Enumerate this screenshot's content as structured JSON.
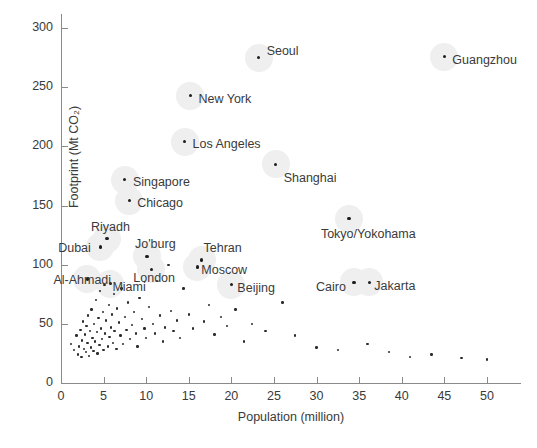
{
  "chart_data": {
    "type": "scatter",
    "title": "",
    "xlabel": "Population (million)",
    "ylabel": "Footprint (Mt CO₂)",
    "xlim": [
      0,
      54
    ],
    "ylim": [
      0,
      312
    ],
    "xticks": [
      0,
      5,
      10,
      15,
      20,
      25,
      30,
      35,
      40,
      45,
      50
    ],
    "yticks": [
      0,
      50,
      100,
      150,
      200,
      250,
      300
    ],
    "grid": false,
    "legend": null,
    "labeled_points": [
      {
        "label": "Seoul",
        "x": 23.2,
        "y": 275,
        "label_dx": 8,
        "label_dy": -6
      },
      {
        "label": "Guangzhou",
        "x": 45.0,
        "y": 276,
        "label_dx": 8,
        "label_dy": 4
      },
      {
        "label": "New York",
        "x": 15.2,
        "y": 243,
        "label_dx": 8,
        "label_dy": 4
      },
      {
        "label": "Los Angeles",
        "x": 14.5,
        "y": 204,
        "label_dx": 8,
        "label_dy": 3
      },
      {
        "label": "Shanghai",
        "x": 25.2,
        "y": 185,
        "label_dx": 8,
        "label_dy": 15
      },
      {
        "label": "Singapore",
        "x": 7.5,
        "y": 172,
        "label_dx": 8,
        "label_dy": 3
      },
      {
        "label": "Chicago",
        "x": 8.0,
        "y": 154,
        "label_dx": 8,
        "label_dy": 3
      },
      {
        "label": "Tokyo/Yokohama",
        "x": 33.8,
        "y": 139,
        "label_dx": -28,
        "label_dy": 16
      },
      {
        "label": "Riyadh",
        "x": 5.4,
        "y": 122,
        "label_dx": -16,
        "label_dy": -11
      },
      {
        "label": "Dubai",
        "x": 4.6,
        "y": 115,
        "label_dx": -42,
        "label_dy": 2
      },
      {
        "label": "Jo'burg",
        "x": 10.1,
        "y": 107,
        "label_dx": -12,
        "label_dy": -11
      },
      {
        "label": "Tehran",
        "x": 16.5,
        "y": 104,
        "label_dx": 2,
        "label_dy": -11
      },
      {
        "label": "Moscow",
        "x": 16.0,
        "y": 98,
        "label_dx": 4,
        "label_dy": 4
      },
      {
        "label": "London",
        "x": 10.6,
        "y": 96,
        "label_dx": -18,
        "label_dy": 10
      },
      {
        "label": "Al-Ahmadi",
        "x": 3.1,
        "y": 88,
        "label_dx": -34,
        "label_dy": 2
      },
      {
        "label": "Miami",
        "x": 5.8,
        "y": 84,
        "label_dx": 2,
        "label_dy": 4
      },
      {
        "label": "Beijing",
        "x": 20.0,
        "y": 83,
        "label_dx": 6,
        "label_dy": 4
      },
      {
        "label": "Cairo",
        "x": 34.4,
        "y": 85,
        "label_dx": -38,
        "label_dy": 6
      },
      {
        "label": "Jakarta",
        "x": 36.2,
        "y": 85,
        "label_dx": 5,
        "label_dy": 5
      }
    ],
    "unlabeled_points": [
      {
        "x": 1.2,
        "y": 33
      },
      {
        "x": 1.5,
        "y": 28
      },
      {
        "x": 1.8,
        "y": 40
      },
      {
        "x": 2.0,
        "y": 24
      },
      {
        "x": 2.1,
        "y": 31
      },
      {
        "x": 2.3,
        "y": 45
      },
      {
        "x": 2.4,
        "y": 22
      },
      {
        "x": 2.5,
        "y": 36
      },
      {
        "x": 2.6,
        "y": 52
      },
      {
        "x": 2.7,
        "y": 29
      },
      {
        "x": 2.8,
        "y": 41
      },
      {
        "x": 2.9,
        "y": 26
      },
      {
        "x": 3.0,
        "y": 48
      },
      {
        "x": 3.1,
        "y": 34
      },
      {
        "x": 3.2,
        "y": 57
      },
      {
        "x": 3.3,
        "y": 23
      },
      {
        "x": 3.4,
        "y": 44
      },
      {
        "x": 3.5,
        "y": 30
      },
      {
        "x": 3.6,
        "y": 62
      },
      {
        "x": 3.7,
        "y": 38
      },
      {
        "x": 3.8,
        "y": 27
      },
      {
        "x": 3.9,
        "y": 50
      },
      {
        "x": 4.0,
        "y": 35
      },
      {
        "x": 4.1,
        "y": 70
      },
      {
        "x": 4.2,
        "y": 43
      },
      {
        "x": 4.3,
        "y": 25
      },
      {
        "x": 4.4,
        "y": 55
      },
      {
        "x": 4.5,
        "y": 32
      },
      {
        "x": 4.6,
        "y": 78
      },
      {
        "x": 4.7,
        "y": 46
      },
      {
        "x": 4.8,
        "y": 37
      },
      {
        "x": 4.9,
        "y": 60
      },
      {
        "x": 5.0,
        "y": 28
      },
      {
        "x": 5.1,
        "y": 83
      },
      {
        "x": 5.2,
        "y": 42
      },
      {
        "x": 5.3,
        "y": 53
      },
      {
        "x": 5.5,
        "y": 31
      },
      {
        "x": 5.6,
        "y": 66
      },
      {
        "x": 5.7,
        "y": 39
      },
      {
        "x": 5.9,
        "y": 47
      },
      {
        "x": 6.0,
        "y": 58
      },
      {
        "x": 6.1,
        "y": 34
      },
      {
        "x": 6.2,
        "y": 75
      },
      {
        "x": 6.3,
        "y": 44
      },
      {
        "x": 6.5,
        "y": 29
      },
      {
        "x": 6.6,
        "y": 63
      },
      {
        "x": 6.8,
        "y": 51
      },
      {
        "x": 7.0,
        "y": 40
      },
      {
        "x": 7.1,
        "y": 80
      },
      {
        "x": 7.3,
        "y": 33
      },
      {
        "x": 7.5,
        "y": 56
      },
      {
        "x": 7.7,
        "y": 45
      },
      {
        "x": 7.9,
        "y": 68
      },
      {
        "x": 8.1,
        "y": 37
      },
      {
        "x": 8.3,
        "y": 49
      },
      {
        "x": 8.6,
        "y": 60
      },
      {
        "x": 8.8,
        "y": 42
      },
      {
        "x": 9.0,
        "y": 31
      },
      {
        "x": 9.2,
        "y": 72
      },
      {
        "x": 9.5,
        "y": 54
      },
      {
        "x": 9.8,
        "y": 46
      },
      {
        "x": 10.0,
        "y": 38
      },
      {
        "x": 10.3,
        "y": 64
      },
      {
        "x": 10.8,
        "y": 50
      },
      {
        "x": 11.0,
        "y": 42
      },
      {
        "x": 11.3,
        "y": 86
      },
      {
        "x": 11.6,
        "y": 57
      },
      {
        "x": 12.0,
        "y": 35
      },
      {
        "x": 12.2,
        "y": 47
      },
      {
        "x": 12.6,
        "y": 100
      },
      {
        "x": 12.9,
        "y": 61
      },
      {
        "x": 13.2,
        "y": 44
      },
      {
        "x": 13.6,
        "y": 53
      },
      {
        "x": 14.0,
        "y": 38
      },
      {
        "x": 14.4,
        "y": 80
      },
      {
        "x": 15.0,
        "y": 58
      },
      {
        "x": 15.5,
        "y": 46
      },
      {
        "x": 16.8,
        "y": 52
      },
      {
        "x": 17.4,
        "y": 66
      },
      {
        "x": 18.0,
        "y": 41
      },
      {
        "x": 18.8,
        "y": 56
      },
      {
        "x": 19.5,
        "y": 48
      },
      {
        "x": 20.5,
        "y": 62
      },
      {
        "x": 21.5,
        "y": 35
      },
      {
        "x": 22.4,
        "y": 50
      },
      {
        "x": 24.0,
        "y": 44
      },
      {
        "x": 26.0,
        "y": 68
      },
      {
        "x": 27.5,
        "y": 40
      },
      {
        "x": 30.0,
        "y": 30
      },
      {
        "x": 32.5,
        "y": 28
      },
      {
        "x": 36.0,
        "y": 33
      },
      {
        "x": 38.5,
        "y": 26
      },
      {
        "x": 41.0,
        "y": 22
      },
      {
        "x": 43.5,
        "y": 24
      },
      {
        "x": 47.0,
        "y": 21
      },
      {
        "x": 50.0,
        "y": 20
      }
    ],
    "haloed_points": [
      "Seoul",
      "Guangzhou",
      "New York",
      "Los Angeles",
      "Shanghai",
      "Singapore",
      "Chicago",
      "Tokyo/Yokohama",
      "Riyadh",
      "Dubai",
      "Jo'burg",
      "Tehran",
      "Moscow",
      "London",
      "Al-Ahmadi",
      "Miami",
      "Beijing",
      "Cairo",
      "Jakarta"
    ],
    "colors": {
      "point": "#2b2b2b",
      "halo": "#efefef",
      "axis": "#8a8a8a",
      "text": "#3a3a3a"
    }
  }
}
